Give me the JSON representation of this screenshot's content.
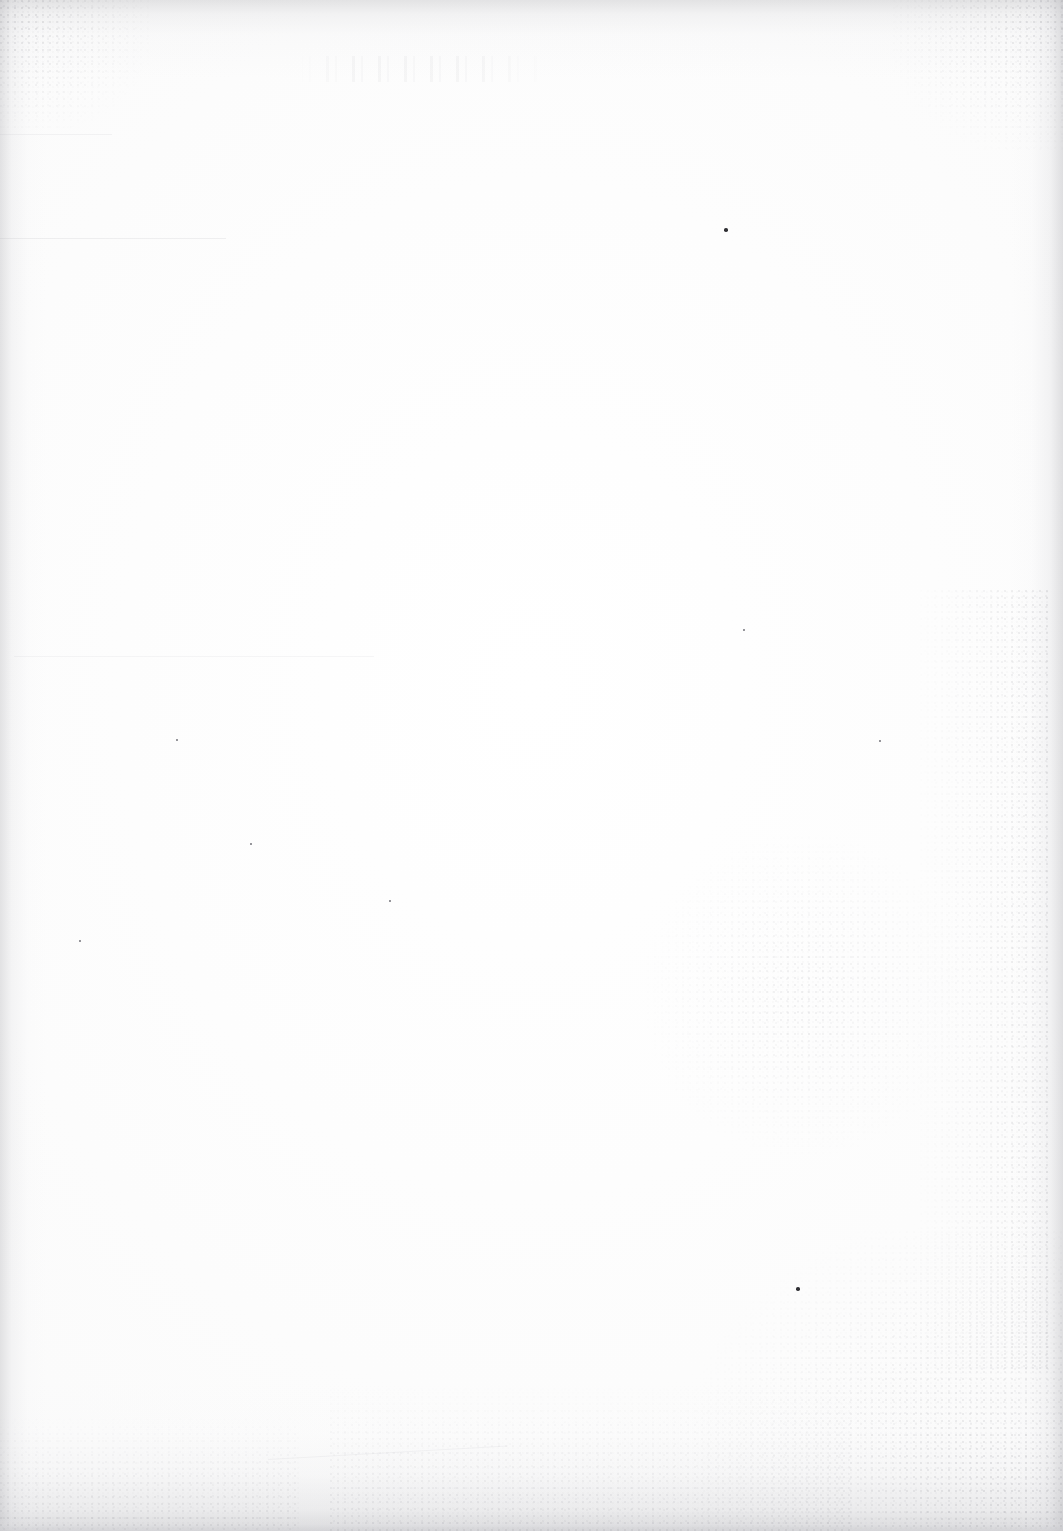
{
  "document": {
    "kind": "scanned-page",
    "page_content_text": "",
    "visible_text_present": false,
    "background_color": "#fdfdfd",
    "page_width_px": 1063,
    "page_height_px": 1531
  },
  "artifacts": {
    "edge_shadow_color": "#a8a8ac",
    "bottom_shadow_color": "#96969b",
    "grain_color": "#78788 0",
    "ghost_smudge_color": "#afafb6",
    "specks": [
      {
        "name": "speck-upper-right",
        "x": 724,
        "y": 228,
        "size": 4,
        "color": "#2f2f33"
      },
      {
        "name": "speck-lower-center",
        "x": 796,
        "y": 1287,
        "size": 4,
        "color": "#2f2f33"
      },
      {
        "name": "speck-left-mid",
        "x": 176,
        "y": 739,
        "size": 2,
        "color": "#78787e"
      },
      {
        "name": "speck-center-low",
        "x": 389,
        "y": 900,
        "size": 2,
        "color": "#78787e"
      },
      {
        "name": "speck-right-mid",
        "x": 879,
        "y": 740,
        "size": 2,
        "color": "#78787e"
      },
      {
        "name": "speck-right-upper",
        "x": 743,
        "y": 629,
        "size": 2,
        "color": "#78787e"
      },
      {
        "name": "speck-left-upper",
        "x": 250,
        "y": 843,
        "size": 2,
        "color": "#78787e"
      },
      {
        "name": "speck-bottom-left",
        "x": 79,
        "y": 940,
        "size": 2,
        "color": "#78787e"
      }
    ]
  }
}
